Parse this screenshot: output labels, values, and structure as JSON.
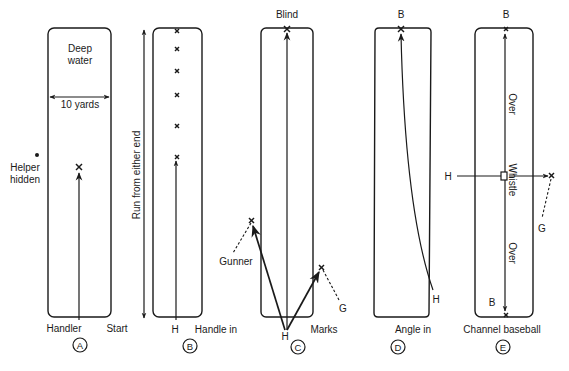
{
  "figure": {
    "type": "retriever training drill diagrams",
    "panels": [
      {
        "id": "A",
        "badge": "A",
        "labels": {
          "area": [
            "Deep",
            "water"
          ],
          "width": "10 yards",
          "helper": [
            "Helper",
            "hidden"
          ],
          "bottom_left": "Handler",
          "bottom_right": "Start"
        }
      },
      {
        "id": "B",
        "badge": "B",
        "labels": {
          "side": "Run from either end",
          "bottom_left": "H",
          "bottom_right": "Handle in"
        },
        "mark_count": 6
      },
      {
        "id": "C",
        "badge": "C",
        "labels": {
          "top": "Blind",
          "gunner": "Gunner",
          "g": "G",
          "handler": "H",
          "bottom_right": "Marks"
        }
      },
      {
        "id": "D",
        "badge": "D",
        "labels": {
          "top": "B",
          "handler": "H",
          "bottom_right": "Angle in"
        }
      },
      {
        "id": "E",
        "badge": "E",
        "labels": {
          "top": "B",
          "bottom_b": "B",
          "handler": "H",
          "over_top": "Over",
          "whistle": "Whistle",
          "over_bottom": "Over",
          "g": "G",
          "bottom": "Channel baseball"
        }
      }
    ]
  },
  "colors": {
    "ink": "#1a1a1a",
    "background": "#ffffff"
  }
}
